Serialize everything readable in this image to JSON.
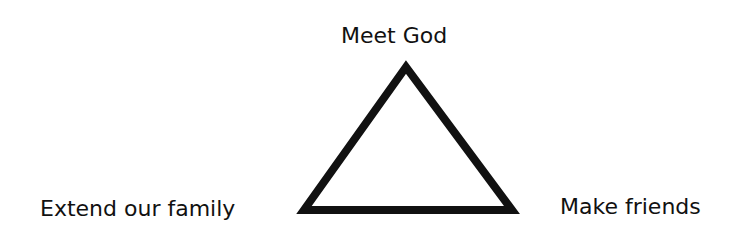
{
  "diagram": {
    "type": "triangle",
    "vertices": [
      {
        "position": "top",
        "label": "Meet God"
      },
      {
        "position": "bottom-left",
        "label": "Extend our family"
      },
      {
        "position": "bottom-right",
        "label": "Make friends"
      }
    ],
    "stroke_color": "#111111",
    "background_color": "#ffffff"
  }
}
